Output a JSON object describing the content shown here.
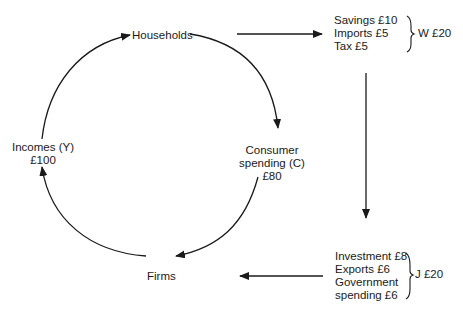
{
  "diagram": {
    "type": "circular-flow-of-income",
    "nodes": {
      "households": {
        "label": "Households"
      },
      "consumer_spending": {
        "line1": "Consumer",
        "line2": "spending (C)",
        "value": "£80"
      },
      "firms": {
        "label": "Firms"
      },
      "incomes": {
        "line1": "Incomes (Y)",
        "value": "£100"
      }
    },
    "withdrawals": {
      "items": [
        "Savings £10",
        "Imports £5",
        "Tax £5"
      ],
      "total_label": "W £20"
    },
    "injections": {
      "items": [
        "Investment £8",
        "Exports £6",
        "Government",
        "spending £6"
      ],
      "total_label": "J £20"
    },
    "edges": [
      {
        "from": "incomes",
        "to": "households"
      },
      {
        "from": "households",
        "to": "consumer_spending"
      },
      {
        "from": "consumer_spending",
        "to": "firms"
      },
      {
        "from": "firms",
        "to": "incomes"
      },
      {
        "from": "households",
        "to": "withdrawals"
      },
      {
        "from": "withdrawals",
        "to": "injections"
      },
      {
        "from": "injections",
        "to": "firms"
      }
    ],
    "line_color": "#1a1a1a"
  }
}
